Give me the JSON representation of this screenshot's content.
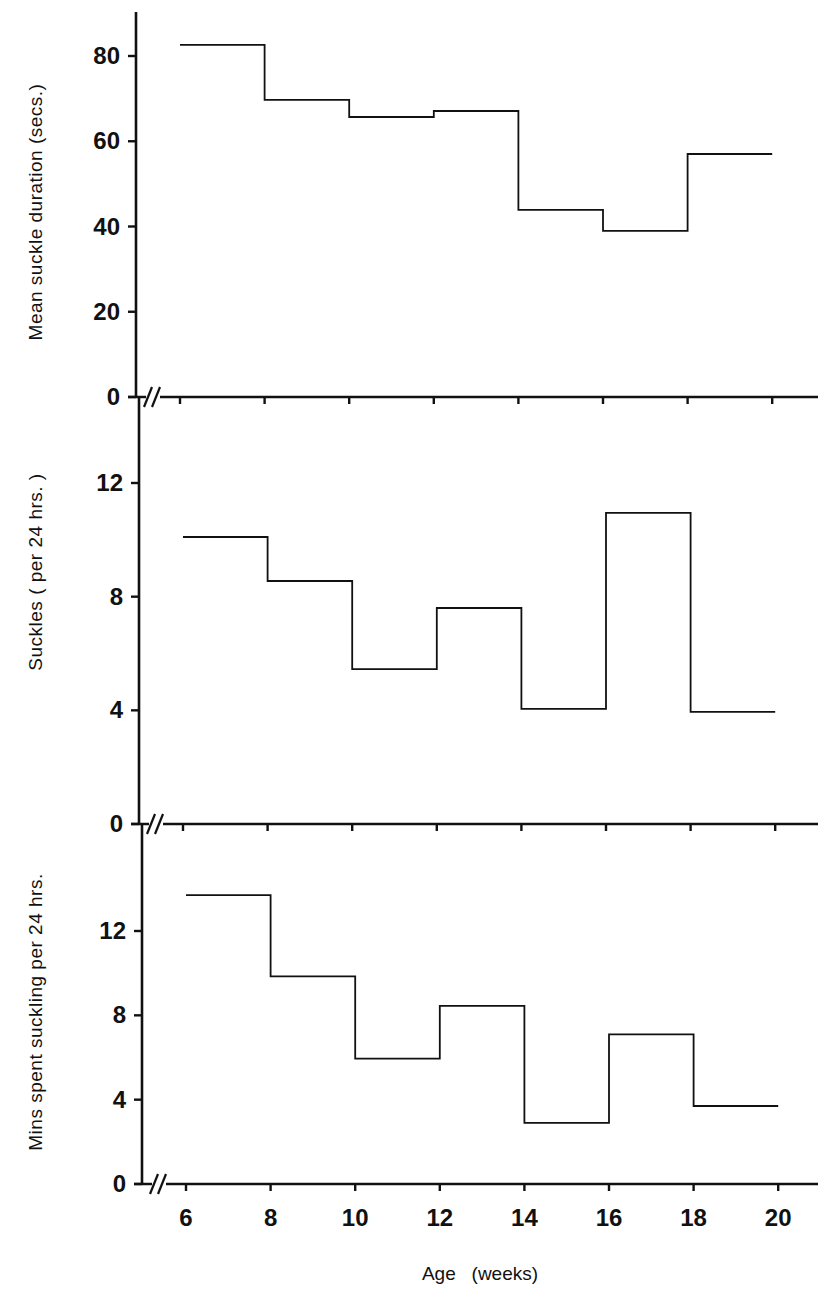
{
  "figure": {
    "xlabel": "Age   (weeks)",
    "x_tick_labels": [
      "6",
      "8",
      "10",
      "12",
      "14",
      "16",
      "18",
      "20"
    ]
  },
  "chart_data": [
    {
      "type": "line",
      "subtype": "step",
      "title": "",
      "xlabel": "Age (weeks)",
      "ylabel": "Mean  suckle  duration    (secs.)",
      "x_edges": [
        6,
        8,
        10,
        12,
        14,
        16,
        18,
        20
      ],
      "values": [
        82.6,
        69.7,
        65.7,
        67.1,
        43.9,
        39.0,
        57.0
      ],
      "yticks": [
        0,
        20,
        40,
        60,
        80
      ],
      "ylim": [
        0,
        90
      ],
      "xlim": [
        5,
        21
      ],
      "x_axis_break": true,
      "grid": false,
      "legend": null
    },
    {
      "type": "line",
      "subtype": "step",
      "title": "",
      "xlabel": "Age (weeks)",
      "ylabel": "Suckles    ( per  24 hrs. )",
      "x_edges": [
        6,
        8,
        10,
        12,
        14,
        16,
        18,
        20
      ],
      "values": [
        10.1,
        8.55,
        5.45,
        7.6,
        4.05,
        10.95,
        3.95
      ],
      "yticks": [
        0,
        4,
        8,
        12
      ],
      "ylim": [
        0,
        14.5
      ],
      "xlim": [
        5,
        21
      ],
      "x_axis_break": true,
      "grid": false,
      "legend": null
    },
    {
      "type": "line",
      "subtype": "step",
      "title": "",
      "xlabel": "Age (weeks)",
      "ylabel": "Mins  spent  suckling  per  24  hrs.",
      "x_edges": [
        6,
        8,
        10,
        12,
        14,
        16,
        18,
        20
      ],
      "values": [
        13.7,
        9.85,
        5.95,
        8.45,
        2.9,
        7.1,
        3.7
      ],
      "yticks": [
        0,
        4,
        8,
        12
      ],
      "ylim": [
        0,
        17.5
      ],
      "xlim": [
        5,
        21
      ],
      "x_axis_break": true,
      "grid": false,
      "legend": null
    }
  ],
  "panels": [
    {
      "ylabel": "Mean  suckle  duration    (secs.)"
    },
    {
      "ylabel": "Suckles    ( per  24 hrs. )"
    },
    {
      "ylabel": "Mins  spent  suckling  per  24  hrs."
    }
  ],
  "colors": {
    "ink": "#111111",
    "background": "#ffffff"
  }
}
